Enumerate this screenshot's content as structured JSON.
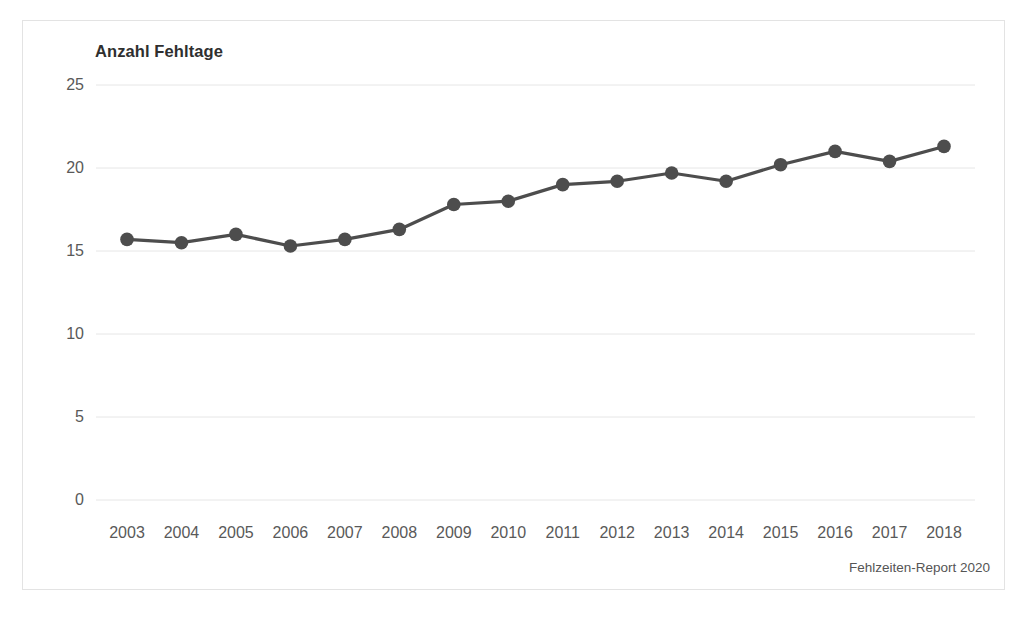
{
  "figure": {
    "title": "Anzahl Fehltage",
    "source_note": "Fehlzeiten-Report 2020"
  },
  "chart_data": {
    "type": "line",
    "title": "Anzahl Fehltage",
    "xlabel": "",
    "ylabel": "Anzahl Fehltage",
    "categories": [
      "2003",
      "2004",
      "2005",
      "2006",
      "2007",
      "2008",
      "2009",
      "2010",
      "2011",
      "2012",
      "2013",
      "2014",
      "2015",
      "2016",
      "2017",
      "2018"
    ],
    "values": [
      15.7,
      15.5,
      16.0,
      15.3,
      15.7,
      16.3,
      17.8,
      18.0,
      19.0,
      19.2,
      19.7,
      19.2,
      20.2,
      21.0,
      20.4,
      21.3
    ],
    "series": [
      {
        "name": "Anzahl Fehltage",
        "values": [
          15.7,
          15.5,
          16.0,
          15.3,
          15.7,
          16.3,
          17.8,
          18.0,
          19.0,
          19.2,
          19.7,
          19.2,
          20.2,
          21.0,
          20.4,
          21.3
        ],
        "color": "#4d4d4d",
        "marker": "circle"
      }
    ],
    "ylim": [
      0,
      25
    ],
    "yticks": [
      0,
      5,
      10,
      15,
      20,
      25
    ],
    "ytick_labels": [
      "0",
      "5",
      "10",
      "15",
      "20",
      "25"
    ],
    "xtick_labels": [
      "2003",
      "2004",
      "2005",
      "2006",
      "2007",
      "2008",
      "2009",
      "2010",
      "2011",
      "2012",
      "2013",
      "2014",
      "2015",
      "2016",
      "2017",
      "2018"
    ],
    "grid": true,
    "grid_axis": "y",
    "grid_color": "#e6e6e6",
    "legend": false,
    "legend_position": "none",
    "annotations": [
      "Fehlzeiten-Report 2020"
    ],
    "line_color": "#4d4d4d",
    "background_color": "#ffffff",
    "frame_color": "#e3e3e3"
  }
}
